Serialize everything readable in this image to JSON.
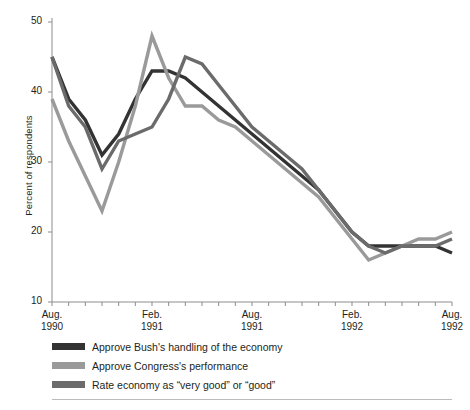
{
  "chart_data": {
    "type": "line",
    "title": "",
    "subtitle": "",
    "xlabel": "",
    "ylabel": "Percent of respondents",
    "ylim": [
      10,
      50
    ],
    "yticks": [
      10,
      20,
      30,
      40,
      50
    ],
    "ytick_labels": [
      "10",
      "20",
      "30",
      "40",
      "50"
    ],
    "grid": false,
    "legend_position": "below-axis-left",
    "x_axis": {
      "start": "Aug. 1990",
      "end": "Aug. 1992",
      "tick_interval": "monthly",
      "tick_count": 25,
      "labels": [
        {
          "line1": "Aug.",
          "line2": "1990",
          "index": 0
        },
        {
          "line1": "Feb.",
          "line2": "1991",
          "index": 6
        },
        {
          "line1": "Aug.",
          "line2": "1991",
          "index": 12
        },
        {
          "line1": "Feb.",
          "line2": "1992",
          "index": 18
        },
        {
          "line1": "Aug.",
          "line2": "1992",
          "index": 24
        }
      ]
    },
    "x": [
      0,
      1,
      2,
      3,
      4,
      5,
      6,
      7,
      8,
      9,
      10,
      11,
      12,
      13,
      14,
      15,
      16,
      17,
      18,
      19,
      20,
      21,
      22,
      23,
      24
    ],
    "series": [
      {
        "name": "Approve Bush's handling of the economy",
        "color": "#333333",
        "values": [
          45,
          39,
          36,
          31,
          34,
          39,
          43,
          43,
          42,
          40,
          38,
          36,
          34,
          32,
          30,
          28,
          26,
          23,
          20,
          18,
          18,
          18,
          18,
          18,
          17
        ]
      },
      {
        "name": "Approve Congress's performance",
        "color": "#9a9a9a",
        "values": [
          39,
          33,
          28,
          23,
          30,
          38,
          48,
          42,
          38,
          38,
          36,
          35,
          33,
          31,
          29,
          27,
          25,
          22,
          19,
          16,
          17,
          18,
          19,
          19,
          20
        ]
      },
      {
        "name": "Rate economy as \"very good\" or \"good\"",
        "color": "#6b6b6b",
        "values": [
          45,
          38,
          35,
          29,
          33,
          34,
          35,
          39,
          45,
          44,
          41,
          38,
          35,
          33,
          31,
          29,
          26,
          23,
          20,
          18,
          17,
          18,
          18,
          18,
          19
        ]
      }
    ]
  },
  "legend": {
    "items": [
      {
        "label": "Approve Bush's handling of the economy",
        "color": "#333333"
      },
      {
        "label": "Approve Congress's performance",
        "color": "#9a9a9a"
      },
      {
        "label": "Rate economy as “very good” or “good”",
        "color": "#6b6b6b"
      }
    ]
  }
}
